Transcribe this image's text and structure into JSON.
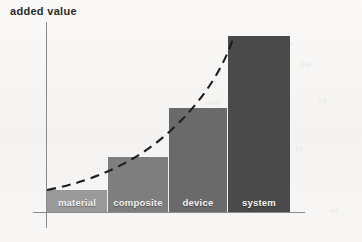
{
  "axis_title": "added value",
  "colors": {
    "background": "#f7f6f4",
    "axis": "#8a8a8a",
    "curve": "#1f1f1f",
    "label_text": "#f2f2f2"
  },
  "chart_data": {
    "type": "bar",
    "title": "added value",
    "xlabel": "",
    "ylabel": "added value",
    "grid": false,
    "legend": false,
    "categories": [
      "material",
      "composite",
      "device",
      "system"
    ],
    "values": [
      22,
      55,
      104,
      176
    ],
    "ylim": [
      0,
      190
    ],
    "value_unit": "relative added value (unitless)",
    "bar_colors": [
      "#9a9a9a",
      "#7e7e7e",
      "#6a6a6a",
      "#4a4a4a"
    ],
    "annotation": {
      "type": "dashed-trend-curve",
      "description": "dashed convex (exponential) curve rising from the origin of the first bar to the top-left corner of the last bar",
      "style": "dashed",
      "color": "#1f1f1f"
    }
  },
  "bars": [
    {
      "label": "material",
      "value": 22,
      "color": "#9a9a9a",
      "x": 47,
      "width": 61,
      "top": 190,
      "height": 22
    },
    {
      "label": "composite",
      "value": 55,
      "color": "#7e7e7e",
      "x": 108,
      "width": 61,
      "top": 157,
      "height": 55
    },
    {
      "label": "device",
      "value": 104,
      "color": "#6a6a6a",
      "x": 169,
      "width": 59,
      "top": 108,
      "height": 104
    },
    {
      "label": "system",
      "value": 176,
      "color": "#4a4a4a",
      "x": 228,
      "width": 62,
      "top": 36,
      "height": 176
    }
  ],
  "ghost_text": [
    {
      "text": "the",
      "x": 300,
      "y": 60
    },
    {
      "text": "on",
      "x": 318,
      "y": 96
    },
    {
      "text": "and",
      "x": 206,
      "y": 98
    },
    {
      "text": "in",
      "x": 246,
      "y": 140
    },
    {
      "text": "to",
      "x": 296,
      "y": 144
    },
    {
      "text": "of",
      "x": 270,
      "y": 186
    },
    {
      "text": "an",
      "x": 330,
      "y": 206
    }
  ]
}
